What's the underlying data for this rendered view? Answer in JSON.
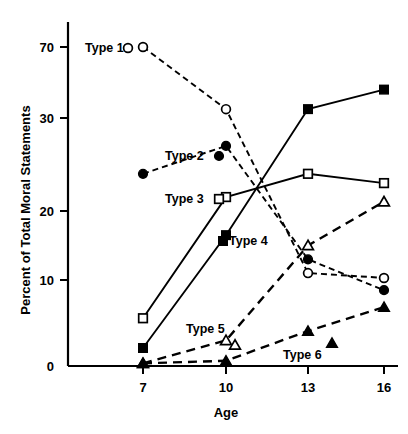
{
  "chart_data": {
    "type": "line",
    "title": "",
    "xlabel": "Age",
    "ylabel": "Percent of Total Moral Statements",
    "x": [
      7,
      10,
      13,
      16
    ],
    "xticklabels": [
      "7",
      "10",
      "13",
      "16"
    ],
    "yticklabels": [
      "0",
      "10",
      "20",
      "30",
      "70"
    ],
    "ytickvalues": [
      0,
      10,
      20,
      30,
      70
    ],
    "ylim": [
      0,
      72
    ],
    "grid": false,
    "legend": "inline-labels",
    "series": [
      {
        "name": "Type 1",
        "label": "Type 1",
        "marker": "open-circle",
        "line": "dashed-small",
        "values": [
          70,
          35,
          11,
          10.3
        ]
      },
      {
        "name": "Type 2",
        "label": "Type 2",
        "marker": "filled-circle",
        "line": "dashed-small",
        "values": [
          24,
          27,
          13,
          8.8
        ]
      },
      {
        "name": "Type 3",
        "label": "Type 3",
        "marker": "open-square",
        "line": "solid",
        "values": [
          5.5,
          21.5,
          24,
          23
        ]
      },
      {
        "name": "Type 4",
        "label": "Type 4",
        "marker": "filled-square",
        "line": "solid",
        "values": [
          2,
          16.5,
          35,
          46
        ]
      },
      {
        "name": "Type 5",
        "label": "Type 5",
        "marker": "open-triangle",
        "line": "dashed-large",
        "values": [
          0.2,
          2.9,
          15,
          21
        ]
      },
      {
        "name": "Type 6",
        "label": "Type 6",
        "marker": "filled-triangle",
        "line": "dashed-large",
        "values": [
          0.2,
          0.5,
          4,
          6.8
        ]
      }
    ],
    "colors": {
      "axis": "#000000",
      "series": "#000000",
      "background": "#ffffff"
    }
  }
}
